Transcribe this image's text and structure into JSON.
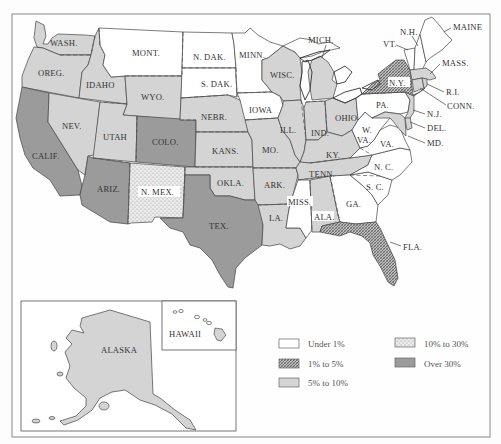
{
  "map": {
    "type": "choropleth",
    "region": "United States",
    "legend": {
      "items": [
        {
          "key": "under1",
          "label": "Under 1%",
          "fill": "white"
        },
        {
          "key": "p1to5",
          "label": "1% to 5%",
          "fill": "hatched"
        },
        {
          "key": "p5to10",
          "label": "5% to 10%",
          "fill": "light-gray"
        },
        {
          "key": "p10to30",
          "label": "10% to 30%",
          "fill": "stippled"
        },
        {
          "key": "over30",
          "label": "Over 30%",
          "fill": "dark-gray"
        }
      ]
    },
    "colors": {
      "under1": "#ffffff",
      "p5to10": "#d4d4d4",
      "over30": "#9b9b9b",
      "hatch_fg": "#555555",
      "hatch_bg": "#bdbdbd",
      "stipple_bg": "#e6e6e6",
      "stipple_dot": "#8a8a8a",
      "frame": "#888888"
    },
    "labels": {
      "wash": "WASH.",
      "oreg": "OREG.",
      "calif": "CALIF.",
      "idaho": "IDAHO",
      "nev": "NEV.",
      "mont": "MONT.",
      "wyo": "WYO.",
      "utah": "UTAH",
      "colo": "COLO.",
      "ariz": "ARIZ.",
      "nmex": "N. MEX.",
      "ndak": "N. DAK.",
      "sdak": "S. DAK.",
      "nebr": "NEBR.",
      "kans": "KANS.",
      "okla": "OKLA.",
      "tex": "TEX.",
      "minn": "MINN.",
      "iowa": "IOWA",
      "mo": "MO.",
      "ark": "ARK.",
      "la": "LA.",
      "wisc": "WISC.",
      "ill": "ILL.",
      "mich": "MICH.",
      "ind": "IND.",
      "ohio": "OHIO",
      "ky": "KY.",
      "tenn": "TENN.",
      "miss": "MISS.",
      "ala": "ALA.",
      "ga": "GA.",
      "fla": "FLA.",
      "sc": "S. C.",
      "nc": "N. C.",
      "va": "VA.",
      "wva1": "W.",
      "wva2": "VA.",
      "pa": "PA.",
      "ny": "N.Y.",
      "nj": "N.J.",
      "del": "DEL.",
      "md": "MD.",
      "conn": "CONN.",
      "ri": "R.I.",
      "mass": "MASS.",
      "vt": "VT.",
      "nh": "N.H.",
      "maine": "MAINE",
      "alaska": "ALASKA",
      "hawaii": "HAWAII"
    },
    "state_categories": {
      "Under 1%": [
        "Mont.",
        "N. Dak.",
        "S. Dak.",
        "Minn.",
        "Iowa",
        "Mich. (Upper)",
        "Pa.",
        "W. Va.",
        "Va.",
        "N.C.",
        "S.C.",
        "Ga.",
        "Miss.",
        "Vt.",
        "N.H.",
        "Maine",
        "Hawaii"
      ],
      "1% to 5%": [
        "N.Y.",
        "Fla."
      ],
      "5% to 10%": [
        "Wash.",
        "Oreg.",
        "Idaho",
        "Nev.",
        "Utah",
        "Wyo.",
        "Nebr.",
        "Kans.",
        "Okla.",
        "Mo.",
        "Ark.",
        "La.",
        "Wisc.",
        "Ill.",
        "Mich.",
        "Ind.",
        "Ohio",
        "Ky.",
        "Tenn.",
        "Ala.",
        "N.J.",
        "Del.",
        "Md.",
        "Conn.",
        "R.I.",
        "Mass.",
        "Alaska"
      ],
      "10% to 30%": [
        "N. Mex."
      ],
      "Over 30%": [
        "Calif.",
        "Ariz.",
        "Colo.",
        "Tex."
      ]
    }
  }
}
